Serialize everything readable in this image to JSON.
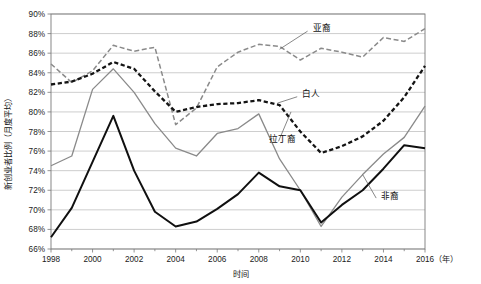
{
  "chart_data": {
    "type": "line",
    "title": "",
    "xlabel": "时间",
    "ylabel": "新创业者比例（月度平均）",
    "x_unit_note": "（年）",
    "x": [
      1998,
      1999,
      2000,
      2001,
      2002,
      2003,
      2004,
      2005,
      2006,
      2007,
      2008,
      2009,
      2010,
      2011,
      2012,
      2013,
      2014,
      2015,
      2016
    ],
    "xlim": [
      1998,
      2016
    ],
    "xtick_labels": [
      "1998",
      "2000",
      "2002",
      "2004",
      "2006",
      "2008",
      "2010",
      "2012",
      "2014",
      "2016"
    ],
    "xticks": [
      1998,
      2000,
      2002,
      2004,
      2006,
      2008,
      2010,
      2012,
      2014,
      2016
    ],
    "ylim": [
      66,
      90
    ],
    "ytick_labels": [
      "66%",
      "68%",
      "70%",
      "72%",
      "74%",
      "76%",
      "78%",
      "80%",
      "82%",
      "84%",
      "86%",
      "88%",
      "90%"
    ],
    "yticks": [
      66,
      68,
      70,
      72,
      74,
      76,
      78,
      80,
      82,
      84,
      86,
      88,
      90
    ],
    "grid": true,
    "legend_position": "inline-annotations",
    "series": [
      {
        "name": "亚裔",
        "color": "#8a8a8a",
        "style": "dashed",
        "width": 1.5,
        "label_x": 2010.6,
        "label_y": 88.6,
        "values": [
          84.9,
          83.0,
          84.2,
          86.8,
          86.2,
          86.6,
          78.7,
          80.4,
          84.6,
          86.1,
          86.9,
          86.7,
          85.3,
          86.5,
          86.1,
          85.6,
          87.6,
          87.2,
          88.5
        ]
      },
      {
        "name": "白人",
        "color": "#141414",
        "style": "dashed-bold",
        "width": 2.3,
        "label_x": 2010.1,
        "label_y": 81.8,
        "values": [
          82.8,
          83.1,
          83.9,
          85.1,
          84.4,
          82.1,
          80.0,
          80.5,
          80.8,
          80.9,
          81.2,
          80.7,
          78.0,
          75.8,
          76.5,
          77.5,
          79.1,
          81.5,
          84.7
        ]
      },
      {
        "name": "拉丁裔",
        "color": "#8a8a8a",
        "style": "solid",
        "width": 1.3,
        "label_x": 2008.5,
        "label_y": 77.2,
        "values": [
          74.5,
          75.5,
          82.3,
          84.4,
          82.0,
          78.8,
          76.3,
          75.5,
          77.8,
          78.3,
          79.8,
          75.2,
          72.0,
          68.3,
          71.3,
          73.6,
          75.7,
          77.4,
          80.6
        ]
      },
      {
        "name": "非裔",
        "color": "#101010",
        "style": "solid-bold",
        "width": 2.0,
        "label_x": 2013.9,
        "label_y": 71.4,
        "values": [
          67.2,
          70.2,
          74.9,
          79.6,
          74.0,
          69.8,
          68.3,
          68.8,
          70.1,
          71.6,
          73.8,
          72.4,
          72.0,
          68.7,
          70.5,
          72.0,
          74.2,
          76.6,
          76.3
        ]
      }
    ]
  },
  "axes": {
    "y_title": "新创业者比例（月度平均）",
    "x_title": "时间",
    "year_unit": "（年）"
  }
}
